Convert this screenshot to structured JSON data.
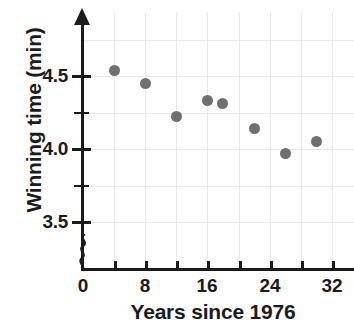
{
  "chart_data": {
    "type": "scatter",
    "title": "",
    "xlabel": "Years since 1976",
    "ylabel": "Winning time (min)",
    "xlim": [
      0,
      33
    ],
    "ylim": [
      3.35,
      4.78
    ],
    "grid": true,
    "legend": "none",
    "y_axis_broken": true,
    "x_ticks": [
      0,
      4,
      8,
      12,
      16,
      20,
      24,
      28,
      32
    ],
    "x_tick_labels": [
      "0",
      "",
      "8",
      "",
      "16",
      "",
      "24",
      "",
      "32"
    ],
    "y_ticks": [
      3.5,
      3.75,
      4.0,
      4.25,
      4.5
    ],
    "y_tick_labels": [
      "3.5",
      "",
      "4.0",
      "",
      "4.5"
    ],
    "point_color": "#707070",
    "axis_color": "#1b1b1b",
    "grid_color": "#e9e9e9",
    "points": [
      {
        "x": 4,
        "y": 4.54
      },
      {
        "x": 8,
        "y": 4.45
      },
      {
        "x": 12,
        "y": 4.22
      },
      {
        "x": 16,
        "y": 4.33
      },
      {
        "x": 18,
        "y": 4.31
      },
      {
        "x": 22,
        "y": 4.14
      },
      {
        "x": 26,
        "y": 3.97
      },
      {
        "x": 30,
        "y": 4.05
      }
    ]
  },
  "axis_titles": {
    "y": "Winning time (min)",
    "x": "Years since 1976"
  },
  "y_tick_text": {
    "t45": "4.5",
    "t40": "4.0",
    "t35": "3.5"
  },
  "x_tick_text": {
    "t0": "0",
    "t8": "8",
    "t16": "16",
    "t24": "24",
    "t32": "32"
  }
}
